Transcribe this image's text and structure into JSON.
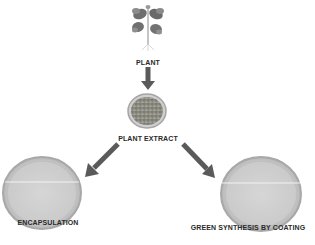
{
  "diagram": {
    "nodes": [
      {
        "id": "plant",
        "label": "PLANT",
        "icon": "plant-icon"
      },
      {
        "id": "extract",
        "label": "PLANT EXTRACT",
        "icon": "petri-dish-extract-icon"
      },
      {
        "id": "encapsulation",
        "label": "ENCAPSULATION",
        "icon": "petri-dish-icon"
      },
      {
        "id": "coating",
        "label": "GREEN SYNTHESIS BY COATING",
        "icon": "petri-dish-icon"
      }
    ],
    "edges": [
      {
        "from": "plant",
        "to": "extract"
      },
      {
        "from": "extract",
        "to": "encapsulation"
      },
      {
        "from": "extract",
        "to": "coating"
      }
    ],
    "colors": {
      "arrow": "#5a5a5a",
      "dish_fill": "#cfcfcf",
      "dish_rim": "#a8a8a8",
      "extract_fill": "#9a9a8e",
      "plant_leaf": "#6a6a6a",
      "text": "#2a2a2a"
    }
  }
}
